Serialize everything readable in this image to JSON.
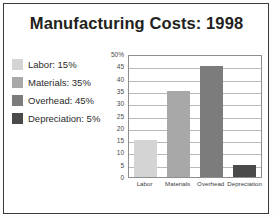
{
  "title": "Manufacturing Costs: 1998",
  "legend": {
    "items": [
      {
        "label": "Labor: 15%",
        "color": "#d4d4d4"
      },
      {
        "label": "Materials: 35%",
        "color": "#a8a8a8"
      },
      {
        "label": "Overhead: 45%",
        "color": "#7c7c7c"
      },
      {
        "label": "Depreciation: 5%",
        "color": "#4a4a4a"
      }
    ]
  },
  "chart_data": {
    "type": "bar",
    "title": "Manufacturing Costs: 1998",
    "xlabel": "",
    "ylabel": "",
    "categories": [
      "Labor",
      "Materials",
      "Overhead",
      "Depreciation"
    ],
    "values": [
      15,
      35,
      45,
      5
    ],
    "colors": [
      "#d4d4d4",
      "#a8a8a8",
      "#7c7c7c",
      "#4a4a4a"
    ],
    "ylim": [
      0,
      50
    ],
    "ytick_labels": [
      "50%",
      "45",
      "40",
      "35",
      "30",
      "25",
      "20",
      "15",
      "10",
      "5",
      "0"
    ],
    "ytick_values": [
      50,
      45,
      40,
      35,
      30,
      25,
      20,
      15,
      10,
      5,
      0
    ],
    "grid": true,
    "legend_position": "left",
    "legend_entries": [
      "Labor: 15%",
      "Materials: 35%",
      "Overhead: 45%",
      "Depreciation: 5%"
    ]
  }
}
